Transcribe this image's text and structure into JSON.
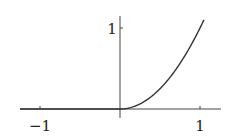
{
  "chart_data": {
    "type": "line",
    "title": "",
    "xlabel": "",
    "ylabel": "",
    "xlim": [
      -1.0,
      1.05
    ],
    "ylim": [
      0,
      1.1
    ],
    "grid": false,
    "legend": null,
    "x_ticks": [
      {
        "value": -1,
        "label": "−1"
      },
      {
        "value": 1,
        "label": "1"
      }
    ],
    "y_ticks": [
      {
        "value": 1,
        "label": "1"
      }
    ],
    "series": [
      {
        "name": "f(x) = 0 for x<0, x^2 for x>=0",
        "x": [
          -1.0,
          -0.5,
          0.0,
          0.1,
          0.2,
          0.3,
          0.4,
          0.5,
          0.6,
          0.7,
          0.8,
          0.9,
          1.0,
          1.05
        ],
        "y": [
          0,
          0,
          0,
          0.01,
          0.04,
          0.09,
          0.16,
          0.25,
          0.36,
          0.49,
          0.64,
          0.81,
          1.0,
          1.1025
        ]
      }
    ],
    "colors": {
      "curve": "#333333",
      "axes": "#444444"
    }
  }
}
